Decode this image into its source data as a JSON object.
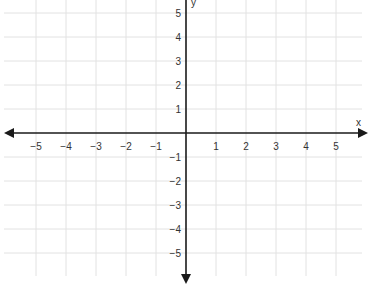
{
  "chart_data": {
    "type": "coordinate-plane",
    "title": "",
    "xlabel": "x",
    "ylabel": "y",
    "xlim": [
      -5,
      5
    ],
    "ylim": [
      -5,
      5
    ],
    "grid": true,
    "x_ticks": [
      "−5",
      "−4",
      "−3",
      "−2",
      "−1",
      "1",
      "2",
      "3",
      "4",
      "5"
    ],
    "y_ticks": [
      "5",
      "4",
      "3",
      "2",
      "1",
      "−1",
      "−2",
      "−3",
      "−4",
      "−5"
    ],
    "series": []
  },
  "labels": {
    "x_axis": "x",
    "y_axis": "y"
  },
  "colors": {
    "grid": "#e2e2e2",
    "axis": "#1a1a1a",
    "text": "#333333"
  }
}
